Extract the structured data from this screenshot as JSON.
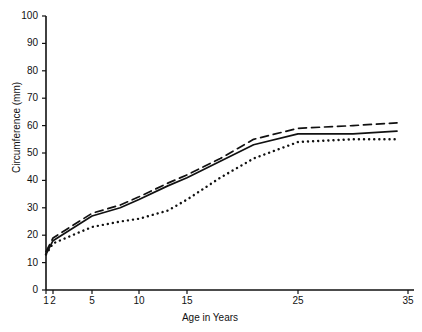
{
  "chart_data": {
    "type": "line",
    "title": "",
    "xlabel": "Age in Years",
    "ylabel": "Circumference (mm)",
    "xlim": [
      1,
      35
    ],
    "ylim": [
      0,
      100
    ],
    "grid": false,
    "legend": "none",
    "xticks": [
      1,
      2,
      5,
      10,
      15,
      25,
      35
    ],
    "xtick_labels": [
      "1",
      "2",
      "5",
      "10",
      "15",
      "25",
      "35"
    ],
    "xtick_px": [
      46,
      53,
      92,
      139,
      187,
      298,
      408
    ],
    "yticks": [
      0,
      10,
      20,
      30,
      40,
      50,
      60,
      70,
      80,
      90,
      100
    ],
    "ytick_labels": [
      "0",
      "10",
      "20",
      "30",
      "40",
      "50",
      "60",
      "70",
      "80",
      "90",
      "100"
    ],
    "series": [
      {
        "name": "Series A (dashed)",
        "style": "dashed",
        "color": "#111111",
        "x": [
          1,
          2,
          3,
          5,
          8,
          10,
          13,
          15,
          18,
          21,
          25,
          30,
          34
        ],
        "values": [
          14,
          19,
          22,
          28,
          31,
          34,
          39,
          42,
          48,
          55,
          59,
          60,
          61
        ]
      },
      {
        "name": "Series B (solid)",
        "style": "solid",
        "color": "#111111",
        "x": [
          1,
          2,
          3,
          5,
          8,
          10,
          13,
          15,
          18,
          21,
          25,
          30,
          34
        ],
        "values": [
          13,
          18,
          21,
          27,
          30,
          33,
          38,
          41,
          47,
          53,
          57,
          57,
          58
        ]
      },
      {
        "name": "Series C (dotted)",
        "style": "dotted",
        "color": "#111111",
        "x": [
          1,
          2,
          3,
          5,
          8,
          10,
          13,
          15,
          18,
          21,
          25,
          30,
          34
        ],
        "values": [
          13,
          17,
          19,
          23,
          25,
          26,
          29,
          33,
          41,
          48,
          54,
          55,
          55
        ]
      }
    ]
  }
}
